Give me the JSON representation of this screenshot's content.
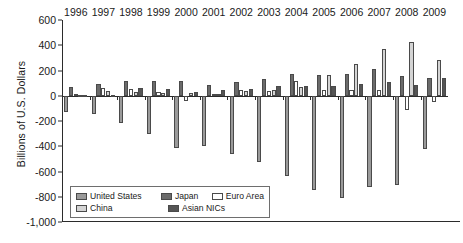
{
  "chart_data": {
    "type": "bar",
    "title": "",
    "subtitle": "",
    "xlabel": "",
    "ylabel": "Billions of U.S. Dollars",
    "categories": [
      "1996",
      "1997",
      "1998",
      "1999",
      "2000",
      "2001",
      "2002",
      "2003",
      "2004",
      "2005",
      "2006",
      "2007",
      "2008",
      "2009"
    ],
    "ylim": [
      -1000,
      600
    ],
    "yticks": [
      600,
      400,
      200,
      0,
      -200,
      -400,
      -600,
      -800,
      -1000
    ],
    "ytick_labels": [
      "600",
      "400",
      "200",
      "0",
      "-200",
      "-400",
      "-600",
      "-800",
      "-1,000"
    ],
    "grid": false,
    "legend_position": "inside-bottom-left",
    "series": [
      {
        "name": "United States",
        "color": "#9a9a9a",
        "values": [
          -130,
          -141,
          -215,
          -301,
          -417,
          -395,
          -459,
          -521,
          -634,
          -748,
          -806,
          -726,
          -707,
          -418
        ]
      },
      {
        "name": "Japan",
        "color": "#6b6b6b",
        "values": [
          66,
          97,
          119,
          115,
          120,
          88,
          112,
          136,
          172,
          166,
          171,
          211,
          157,
          142
        ]
      },
      {
        "name": "Euro Area",
        "color": "#ffffff",
        "values": [
          10,
          63,
          57,
          32,
          -42,
          13,
          47,
          39,
          118,
          49,
          45,
          44,
          -115,
          -48
        ]
      },
      {
        "name": "China",
        "color": "#d4d4d4",
        "values": [
          7,
          37,
          32,
          21,
          21,
          17,
          35,
          46,
          69,
          161,
          250,
          372,
          426,
          284
        ]
      },
      {
        "name": "Asian NICs",
        "color": "#555555",
        "values": [
          2,
          4,
          63,
          51,
          33,
          45,
          53,
          79,
          80,
          80,
          90,
          111,
          84,
          143
        ]
      }
    ]
  },
  "legend": {
    "items": [
      {
        "label": "United States"
      },
      {
        "label": "Japan"
      },
      {
        "label": "Euro Area"
      },
      {
        "label": "China"
      },
      {
        "label": "Asian NICs"
      }
    ]
  }
}
